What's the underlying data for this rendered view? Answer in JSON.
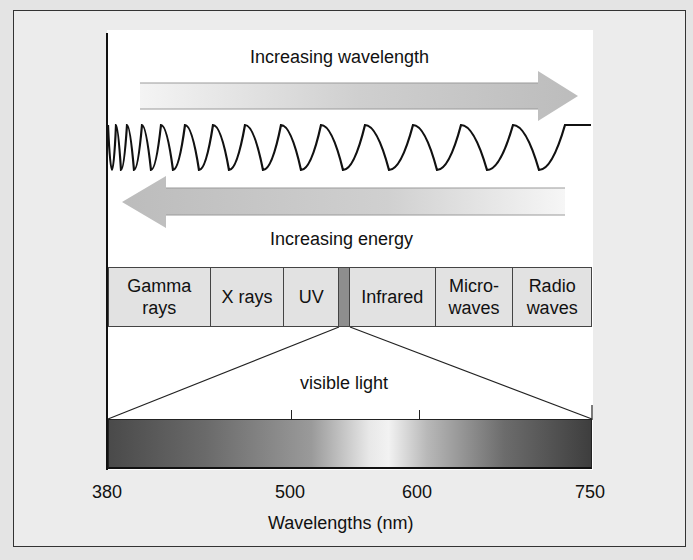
{
  "diagram": {
    "title_top": "Increasing wavelength",
    "title_energy": "Increasing energy",
    "visible_label": "visible light",
    "bands": [
      {
        "label": "Gamma rays",
        "lines": [
          "Gamma",
          "rays"
        ]
      },
      {
        "label": "X rays",
        "lines": [
          "X rays"
        ]
      },
      {
        "label": "UV",
        "lines": [
          "UV"
        ]
      },
      {
        "label": "",
        "lines": [
          ""
        ]
      },
      {
        "label": "Infrared",
        "lines": [
          "Infrared"
        ]
      },
      {
        "label": "Microwaves",
        "lines": [
          "Micro-",
          "waves"
        ]
      },
      {
        "label": "Radio waves",
        "lines": [
          "Radio",
          "waves"
        ]
      }
    ],
    "axis": {
      "ticks": [
        "380",
        "500",
        "600",
        "750"
      ],
      "xlabel": "Wavelengths (nm)"
    },
    "colors": {
      "arrow": "#bdbdbd",
      "band_fill": "#e2e2e2",
      "visible_strip": "#8e8e8e"
    }
  }
}
